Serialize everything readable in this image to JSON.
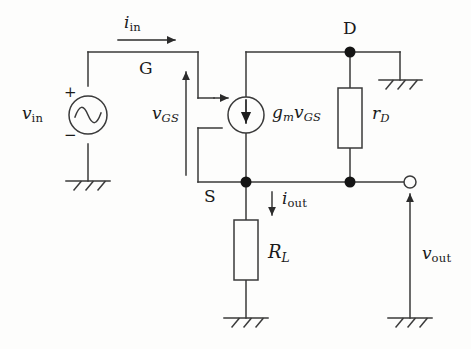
{
  "figure": {
    "type": "circuit-schematic",
    "line_color": "#3a3a3a",
    "text_color": "#1a1a1a",
    "background_color": "#fdfdfc"
  },
  "labels": {
    "v_in": {
      "base": "v",
      "sub": "in"
    },
    "i_in": {
      "base": "i",
      "sub": "in"
    },
    "v_gs": {
      "base": "v",
      "sub": "GS"
    },
    "gm_vgs": {
      "g": "g",
      "g_sub": "m",
      "v": "v",
      "v_sub": "GS"
    },
    "r_d": {
      "base": "r",
      "sub": "D"
    },
    "R_L": {
      "base": "R",
      "sub": "L"
    },
    "i_out": {
      "base": "i",
      "sub": "out"
    },
    "v_out": {
      "base": "v",
      "sub": "out"
    },
    "terminal_gate": "G",
    "terminal_drain": "D",
    "terminal_source": "S",
    "plus_sign": "+",
    "minus_sign": "−"
  },
  "components": [
    {
      "name": "input-voltage-source",
      "kind": "ac-source",
      "label": "v_in",
      "polarity_top": "+",
      "polarity_bottom": "−"
    },
    {
      "name": "dependent-current-source",
      "kind": "current-source",
      "label": "gm_vgs",
      "direction": "down"
    },
    {
      "name": "drain-resistor",
      "kind": "resistor",
      "label": "r_d"
    },
    {
      "name": "load-resistor",
      "kind": "resistor",
      "label": "R_L"
    }
  ],
  "nodes": [
    {
      "name": "drain-node",
      "label": "D",
      "filled": true
    },
    {
      "name": "source-node",
      "label": "S",
      "filled": true
    },
    {
      "name": "output-junction-node",
      "label": "",
      "filled": true
    },
    {
      "name": "output-terminal",
      "label": "",
      "filled": false
    }
  ],
  "grounds": [
    {
      "name": "input-ground"
    },
    {
      "name": "drain-ground"
    },
    {
      "name": "load-ground"
    },
    {
      "name": "output-ground"
    }
  ],
  "currents": [
    {
      "name": "input-current",
      "label": "i_in",
      "direction": "right"
    },
    {
      "name": "output-current",
      "label": "i_out",
      "direction": "down"
    }
  ],
  "voltages": [
    {
      "name": "gate-source-voltage",
      "label": "v_gs",
      "direction": "up"
    },
    {
      "name": "output-voltage",
      "label": "v_out",
      "direction": "up"
    }
  ]
}
